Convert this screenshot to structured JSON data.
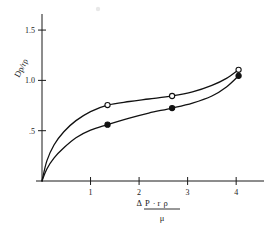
{
  "chart_data": {
    "type": "line",
    "title": "",
    "subtitle": "",
    "xlabel": "ΔP·rρ / μ",
    "xlabel_numerator": "ΔP · r ρ",
    "xlabel_denominator": "μ",
    "xlabel_delta": "Δ",
    "xlabel_num_P": "P",
    "xlabel_num_dot": "·",
    "xlabel_num_r": "r",
    "xlabel_num_rho": "ρ",
    "ylabel": "Dp/rρ",
    "ylabel_D": "D",
    "ylabel_p": "p",
    "ylabel_slash": "/",
    "ylabel_r": "r",
    "ylabel_rho": "ρ",
    "xlim": [
      0,
      4.45
    ],
    "ylim": [
      0,
      1.62
    ],
    "xticks": [
      1,
      2,
      3,
      4
    ],
    "xtick_labels": [
      "1",
      "2",
      "3",
      "4"
    ],
    "yticks": [
      0.5,
      1.0,
      1.5
    ],
    "ytick_labels": [
      ".5",
      "1.0",
      "1.5"
    ],
    "grid": false,
    "legend": "none",
    "series": [
      {
        "name": "open-circle-series",
        "marker": "open-circle",
        "values": [
          {
            "x": 0.0,
            "y": 0.0
          },
          {
            "x": 0.1,
            "y": 0.2
          },
          {
            "x": 0.25,
            "y": 0.36
          },
          {
            "x": 0.45,
            "y": 0.49
          },
          {
            "x": 0.7,
            "y": 0.6
          },
          {
            "x": 1.0,
            "y": 0.69
          },
          {
            "x": 1.35,
            "y": 0.755
          },
          {
            "x": 1.8,
            "y": 0.79
          },
          {
            "x": 2.2,
            "y": 0.815
          },
          {
            "x": 2.68,
            "y": 0.845
          },
          {
            "x": 3.1,
            "y": 0.885
          },
          {
            "x": 3.5,
            "y": 0.95
          },
          {
            "x": 3.8,
            "y": 1.02
          },
          {
            "x": 4.05,
            "y": 1.105
          }
        ],
        "marker_points": [
          {
            "x": 1.35,
            "y": 0.755
          },
          {
            "x": 2.68,
            "y": 0.845
          },
          {
            "x": 4.05,
            "y": 1.105
          }
        ]
      },
      {
        "name": "filled-circle-series",
        "marker": "filled-circle",
        "values": [
          {
            "x": 0.0,
            "y": 0.0
          },
          {
            "x": 0.1,
            "y": 0.12
          },
          {
            "x": 0.25,
            "y": 0.23
          },
          {
            "x": 0.45,
            "y": 0.33
          },
          {
            "x": 0.7,
            "y": 0.43
          },
          {
            "x": 1.0,
            "y": 0.505
          },
          {
            "x": 1.35,
            "y": 0.56
          },
          {
            "x": 1.8,
            "y": 0.625
          },
          {
            "x": 2.2,
            "y": 0.675
          },
          {
            "x": 2.68,
            "y": 0.725
          },
          {
            "x": 3.1,
            "y": 0.775
          },
          {
            "x": 3.5,
            "y": 0.845
          },
          {
            "x": 3.8,
            "y": 0.935
          },
          {
            "x": 4.05,
            "y": 1.045
          }
        ],
        "marker_points": [
          {
            "x": 1.35,
            "y": 0.56
          },
          {
            "x": 2.68,
            "y": 0.725
          },
          {
            "x": 4.05,
            "y": 1.045
          }
        ]
      }
    ]
  }
}
